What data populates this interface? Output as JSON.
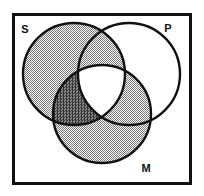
{
  "figure": {
    "kind": "venn-diagram",
    "background_color": "#ffffff",
    "border": {
      "name": "universe-box",
      "stroke_color": "#111111",
      "stroke_width": 3,
      "x": 12,
      "y": 13,
      "width": 180,
      "height": 172
    }
  },
  "labels": {
    "subject": "S",
    "predicate": "P",
    "middle": "M"
  },
  "circles": [
    {
      "id": "S",
      "label": "S",
      "cx": 74,
      "cy": 74,
      "r": 51,
      "stroke_color": "#111111",
      "stroke_width": 2.4,
      "fill": "shaded-light"
    },
    {
      "id": "P",
      "label": "P",
      "cx": 129,
      "cy": 74,
      "r": 51,
      "stroke_color": "#111111",
      "stroke_width": 2.4,
      "fill": "none"
    },
    {
      "id": "M",
      "label": "M",
      "cx": 102,
      "cy": 114,
      "r": 49,
      "stroke_color": "#111111",
      "stroke_width": 2.4,
      "fill": "shaded-light"
    }
  ],
  "shading": {
    "light_tone": "#a8a8a8",
    "dark_tone": "#4a4a4a",
    "light_regions": [
      "S only",
      "S and P",
      "M only",
      "M and P"
    ],
    "dark_regions": [
      "S and M, not P"
    ],
    "unshaded_regions": [
      "P only",
      "S and P and M"
    ]
  },
  "label_positions": {
    "S": {
      "x": 25,
      "y": 33
    },
    "P": {
      "x": 166,
      "y": 32
    },
    "M": {
      "x": 143,
      "y": 172
    }
  }
}
